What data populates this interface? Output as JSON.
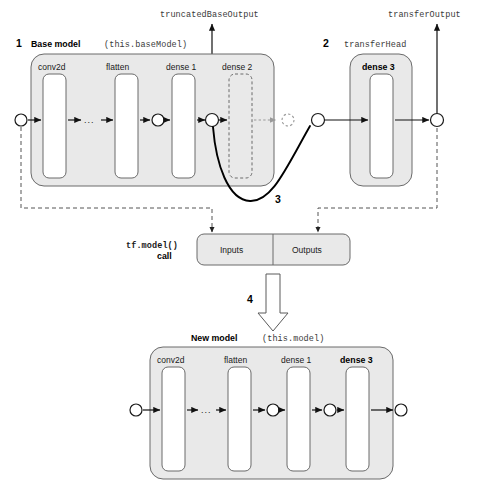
{
  "figure": {
    "type": "diagram"
  },
  "annotations": {
    "step1": "1",
    "step2": "2",
    "step3": "3",
    "step4": "4"
  },
  "outputs": {
    "truncated_base_output": "truncatedBaseOutput",
    "transfer_output": "transferOutput"
  },
  "base_model": {
    "title": "Base model",
    "var_name": "(this.baseModel)",
    "layers": [
      {
        "label": "conv2d",
        "style": "solid"
      },
      {
        "label": "flatten",
        "style": "solid"
      },
      {
        "label": "dense 1",
        "style": "solid"
      },
      {
        "label": "dense 2",
        "style": "dashed"
      }
    ],
    "ellipsis": "..."
  },
  "transfer_head": {
    "title": "transferHead",
    "layers": [
      {
        "label": "dense 3",
        "style": "solid",
        "bold": true
      }
    ]
  },
  "tf_model_call": {
    "caption_line1": "tf.model()",
    "caption_line2": "call",
    "inputs_label": "Inputs",
    "outputs_label": "Outputs"
  },
  "new_model": {
    "title": "New model",
    "var_name": "(this.model)",
    "layers": [
      {
        "label": "conv2d",
        "style": "solid",
        "bold": false
      },
      {
        "label": "flatten",
        "style": "solid",
        "bold": false
      },
      {
        "label": "dense 1",
        "style": "solid",
        "bold": false
      },
      {
        "label": "dense 3",
        "style": "solid",
        "bold": true
      }
    ],
    "ellipsis": "..."
  },
  "colors": {
    "group_fill": "#e9e9e9",
    "group_stroke": "#6a6a6a",
    "layer_fill": "#ffffff",
    "arrow": "#111111",
    "dashed_link": "#555555",
    "ghost": "#9a9a9a"
  }
}
